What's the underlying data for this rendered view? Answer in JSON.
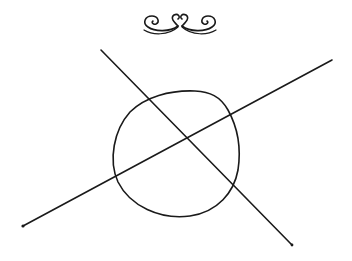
{
  "figure": {
    "background": "#ffffff",
    "ink_color": "#1a1a1a",
    "ornament": {
      "type": "scrollwork-flourish",
      "center_x": 180,
      "center_y": 20
    },
    "circle": {
      "cx": 176,
      "cy": 153,
      "rx": 63,
      "ry": 63
    },
    "lines": [
      {
        "name": "upper-left-to-lower-right",
        "x1": 101,
        "y1": 50,
        "x2": 292,
        "y2": 245
      },
      {
        "name": "lower-left-to-upper-right",
        "x1": 23,
        "y1": 226,
        "x2": 332,
        "y2": 60
      }
    ]
  }
}
